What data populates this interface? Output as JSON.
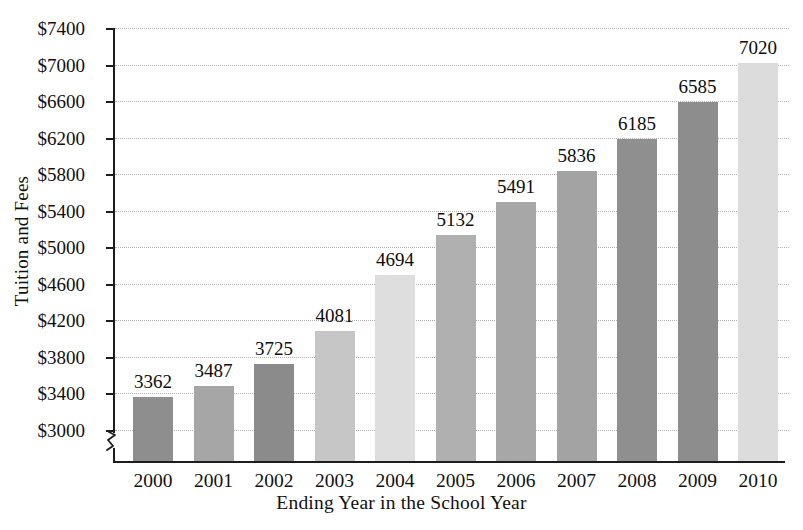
{
  "chart_data": {
    "type": "bar",
    "title": "",
    "xlabel": "Ending Year in the School Year",
    "ylabel": "Tuition and Fees",
    "categories": [
      "2000",
      "2001",
      "2002",
      "2003",
      "2004",
      "2005",
      "2006",
      "2007",
      "2008",
      "2009",
      "2010"
    ],
    "values": [
      3362,
      3487,
      3725,
      4081,
      4694,
      5132,
      5491,
      5836,
      6185,
      6585,
      7020
    ],
    "value_labels": [
      "3362",
      "3487",
      "3725",
      "4081",
      "4694",
      "5132",
      "5491",
      "5836",
      "6185",
      "6585",
      "7020"
    ],
    "bar_colors": [
      "#8e8e8e",
      "#a6a6a6",
      "#8b8b8b",
      "#c6c6c6",
      "#dedede",
      "#b0b0b0",
      "#a7a7a7",
      "#a3a3a3",
      "#8f8f8f",
      "#8d8d8d",
      "#dcdcdc",
      "#a5a5a5"
    ],
    "ylim": [
      3000,
      7400
    ],
    "y_tick_step": 400,
    "y_tick_labels": [
      "$7400",
      "$7000",
      "$6600",
      "$6200",
      "$5800",
      "$5400",
      "$5000",
      "$4600",
      "$4200",
      "$3800",
      "$3400",
      "$3000"
    ],
    "y_tick_values": [
      7400,
      7000,
      6600,
      6200,
      5800,
      5400,
      5000,
      4600,
      4200,
      3800,
      3400,
      3000
    ],
    "grid": true,
    "grid_style": "dotted-horizontal",
    "legend": "none",
    "axis_break": true,
    "axis_break_location": "y-axis-below-3000",
    "colors": {
      "axis": "#1d1d1d",
      "grid": "#b2b2b2",
      "text": "#101010",
      "background": "#ffffff"
    }
  }
}
